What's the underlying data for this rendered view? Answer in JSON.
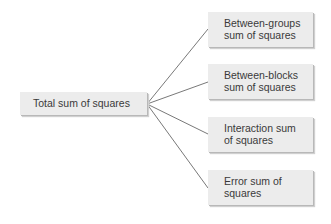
{
  "root": {
    "label": "Total sum of squares"
  },
  "children": [
    {
      "line1": "Between-groups",
      "line2": "sum of squares"
    },
    {
      "line1": "Between-blocks",
      "line2": "sum of squares"
    },
    {
      "line1": "Interaction sum",
      "line2": "of squares"
    },
    {
      "line1": "Error sum of",
      "line2": "squares"
    }
  ]
}
